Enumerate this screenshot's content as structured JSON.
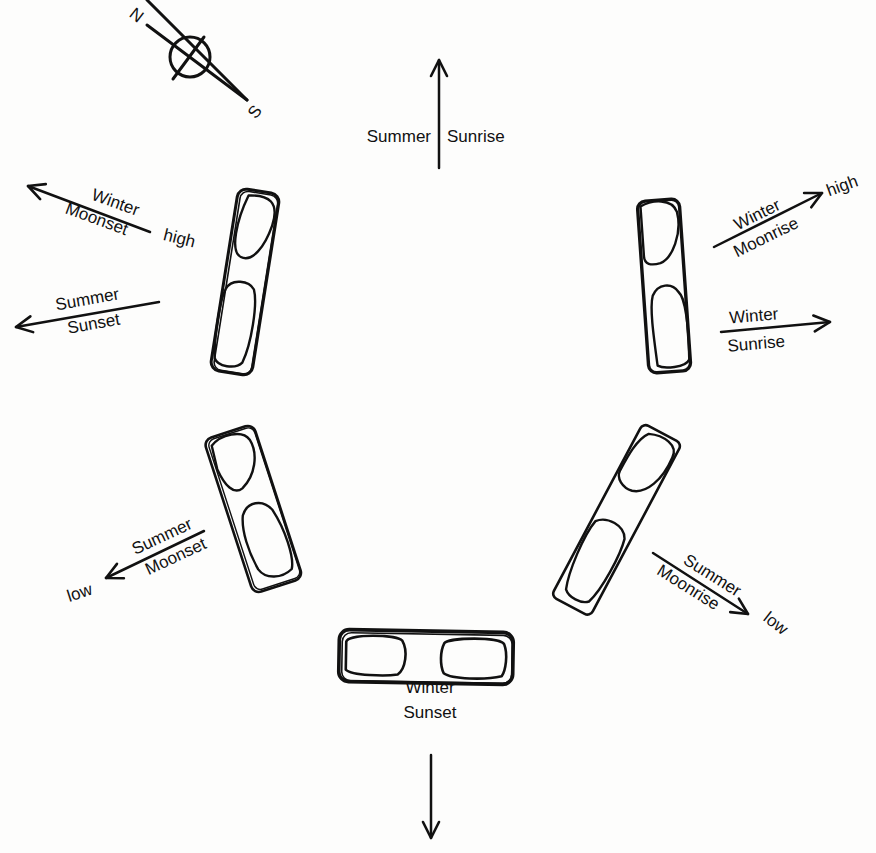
{
  "compass": {
    "north": "N",
    "south": "S"
  },
  "arrows": {
    "summer_sunrise": {
      "left": "Summer",
      "right": "Sunrise"
    },
    "winter_moonset": {
      "top": "Winter",
      "bottom": "Moonset",
      "note": "high"
    },
    "summer_sunset": {
      "top": "Summer",
      "bottom": "Sunset"
    },
    "winter_moonrise": {
      "top": "Winter",
      "bottom": "Moonrise",
      "note": "high"
    },
    "winter_sunrise": {
      "top": "Winter",
      "bottom": "Sunrise"
    },
    "summer_moonset": {
      "top": "Summer",
      "bottom": "Moonset",
      "note": "low"
    },
    "summer_moonrise": {
      "top": "Summer",
      "bottom": "Moonrise",
      "note": "low"
    },
    "winter_sunset": {
      "top": "Winter",
      "bottom": "Sunset"
    }
  },
  "stones": [
    {
      "id": "northwest",
      "position": "upper-left"
    },
    {
      "id": "northeast",
      "position": "upper-right"
    },
    {
      "id": "southwest",
      "position": "lower-left"
    },
    {
      "id": "southeast",
      "position": "lower-right"
    },
    {
      "id": "south",
      "position": "bottom"
    }
  ]
}
